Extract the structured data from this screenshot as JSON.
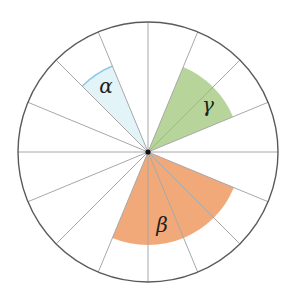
{
  "diagram": {
    "center": [
      148,
      152
    ],
    "radius": 130,
    "divisions": 16,
    "colors": {
      "outline": "#5a5a5a",
      "radii": "#a8a8a8",
      "center_dot": "#111111",
      "alpha_fill": "#e3f4f9",
      "alpha_arc": "#8fcbe0",
      "gamma_fill": "#b7d59b",
      "beta_fill": "#f2a97a"
    },
    "sectors": [
      {
        "label": "α",
        "start_deg": 112.5,
        "end_deg": 135,
        "radius": 93,
        "label_pos": [
          106,
          93
        ]
      },
      {
        "label": "γ",
        "start_deg": 22.5,
        "end_deg": 67.5,
        "radius": 92,
        "label_pos": [
          208,
          112
        ]
      },
      {
        "label": "β",
        "start_deg": 247.5,
        "end_deg": 337.5,
        "radius": 93,
        "label_pos": [
          162,
          232
        ]
      }
    ],
    "labels": {
      "alpha": "α",
      "beta": "β",
      "gamma": "γ"
    }
  }
}
